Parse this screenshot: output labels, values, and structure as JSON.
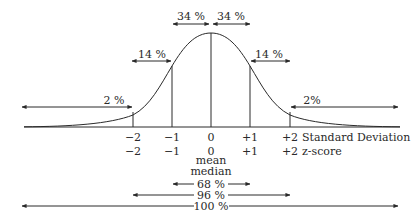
{
  "diagram": {
    "type": "normal-distribution-curve",
    "colors": {
      "ink": "#2a2a2a",
      "background": "#ffffff"
    },
    "percent_bands": {
      "center_left": "34 %",
      "center_right": "34 %",
      "mid_left": "14 %",
      "mid_right": "14 %",
      "tail_left": "2 %",
      "tail_right": "2%"
    },
    "axis": {
      "standard_deviation_label": "Standard Deviation",
      "z_score_label": "z-score",
      "sd_ticks": [
        "−2",
        "−1",
        "0",
        "+1",
        "+2"
      ],
      "z_ticks": [
        "−2",
        "−1",
        "0",
        "+1",
        "+2"
      ],
      "center_labels": [
        "mean",
        "median"
      ]
    },
    "coverage": [
      {
        "label": "68 %",
        "range": "±1 SD"
      },
      {
        "label": "96 %",
        "range": "±2 SD"
      },
      {
        "label": "100 %",
        "range": "full"
      }
    ]
  }
}
